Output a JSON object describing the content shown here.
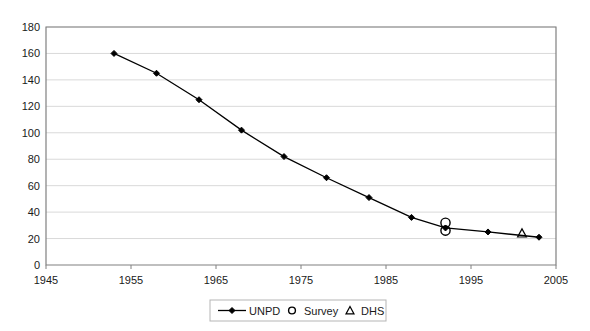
{
  "chart_data": {
    "type": "line",
    "title": "",
    "xlabel": "",
    "ylabel": "",
    "xlim": [
      1945,
      2005
    ],
    "ylim": [
      0,
      180
    ],
    "xticks": [
      "1945",
      "1955",
      "1965",
      "1975",
      "1985",
      "1995",
      "2005"
    ],
    "xtick_values": [
      1945,
      1955,
      1965,
      1975,
      1985,
      1995,
      2005
    ],
    "yticks": [
      "0",
      "20",
      "40",
      "60",
      "80",
      "100",
      "120",
      "140",
      "160",
      "180"
    ],
    "ytick_values": [
      0,
      20,
      40,
      60,
      80,
      100,
      120,
      140,
      160,
      180
    ],
    "grid": "horizontal",
    "legend_position": "bottom-center",
    "series": [
      {
        "name": "UNPD",
        "marker": "diamond",
        "style": "line-with-markers",
        "color": "#000000",
        "x": [
          1953,
          1958,
          1963,
          1968,
          1973,
          1978,
          1983,
          1988,
          1992,
          1997,
          2003
        ],
        "values": [
          160,
          145,
          125,
          102,
          82,
          66,
          51,
          36,
          28,
          25,
          21
        ]
      },
      {
        "name": "Survey",
        "marker": "circle",
        "style": "markers-only",
        "color": "#000000",
        "x": [
          1992,
          1992
        ],
        "values": [
          32,
          26
        ]
      },
      {
        "name": "DHS",
        "marker": "triangle",
        "style": "markers-only",
        "color": "#000000",
        "x": [
          2001
        ],
        "values": [
          24
        ]
      }
    ]
  },
  "legend": {
    "items": [
      {
        "label": "UNPD",
        "marker": "line-diamond-icon"
      },
      {
        "label": "Survey",
        "marker": "circle-icon"
      },
      {
        "label": "DHS",
        "marker": "triangle-icon"
      }
    ]
  },
  "colors": {
    "series": "#000000",
    "grid": "#d9d9d9",
    "axis": "#808080",
    "text": "#1a1a1a",
    "background": "#ffffff",
    "legend_border": "#b5b5b5"
  }
}
